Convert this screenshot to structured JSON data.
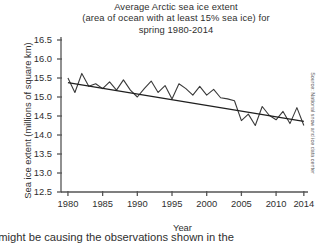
{
  "figure": {
    "title_lines": [
      "Average Arctic sea ice extent",
      "(area of ocean with at least 15% sea ice) for",
      "spring 1980-2014"
    ],
    "source_note": "Source: National snow and ice data center",
    "caption": "t might be causing the observations shown in the"
  },
  "chart_data": {
    "type": "line",
    "title": "Average Arctic sea ice extent (area of ocean with at least 15% sea ice) for spring 1980-2014",
    "xlabel": "Year",
    "ylabel": "Sea ice extent (millions of square km)",
    "xlim": [
      1979,
      2014.6
    ],
    "ylim": [
      12.5,
      16.5
    ],
    "ytick_values": [
      16.5,
      16.0,
      15.5,
      15.0,
      14.5,
      14.0,
      13.5,
      13.0,
      12.5
    ],
    "ytick_labels": [
      "16.5",
      "16.0",
      "15.5",
      "15.0",
      "14.5",
      "14.0",
      "13.5",
      "13.0",
      "12.5"
    ],
    "xtick_values": [
      1980,
      1985,
      1990,
      1995,
      2000,
      2005,
      2010,
      2014
    ],
    "xtick_labels": [
      "1980",
      "1985",
      "1990",
      "1995",
      "2000",
      "2005",
      "2010",
      "2014"
    ],
    "grid": false,
    "legend": "none",
    "line_color": "#3a3a3a",
    "trend_color": "#1f1f1f",
    "axis_color": "#555555",
    "series": [
      {
        "name": "Sea ice extent",
        "x": [
          1980,
          1981,
          1982,
          1983,
          1984,
          1985,
          1986,
          1987,
          1988,
          1989,
          1990,
          1991,
          1992,
          1993,
          1994,
          1995,
          1996,
          1997,
          1998,
          1999,
          2000,
          2001,
          2002,
          2003,
          2004,
          2005,
          2006,
          2007,
          2008,
          2009,
          2010,
          2011,
          2012,
          2013,
          2014
        ],
        "values": [
          15.5,
          15.12,
          15.62,
          15.28,
          15.35,
          15.22,
          15.4,
          15.18,
          15.45,
          15.18,
          15.0,
          15.22,
          15.42,
          15.12,
          15.3,
          14.95,
          15.35,
          15.22,
          15.05,
          15.28,
          15.05,
          15.2,
          14.98,
          14.95,
          14.9,
          14.38,
          14.55,
          14.25,
          14.75,
          14.52,
          14.4,
          14.62,
          14.3,
          14.72,
          14.25
        ]
      }
    ],
    "trendline": {
      "name": "Linear trend",
      "x": [
        1980,
        2014
      ],
      "values": [
        15.38,
        14.36
      ]
    }
  }
}
